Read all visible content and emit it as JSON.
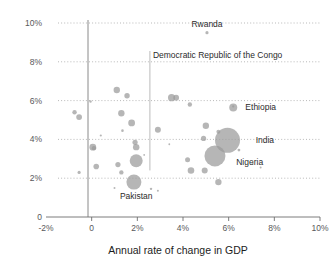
{
  "chart_data": {
    "type": "scatter",
    "title": "",
    "xlabel": "Annual rate of change in GDP",
    "ylabel": "",
    "xlim": [
      -2,
      10
    ],
    "ylim": [
      0,
      10
    ],
    "x_ticks": [
      "-2%",
      "0",
      "2%",
      "4%",
      "6%",
      "8%",
      "10%"
    ],
    "x_tick_values": [
      -2,
      0,
      2,
      4,
      6,
      8,
      10
    ],
    "y_ticks": [
      "0",
      "2%",
      "4%",
      "6%",
      "8%",
      "10%"
    ],
    "y_tick_values": [
      0,
      2,
      4,
      6,
      8,
      10
    ],
    "grid": "horizontal-dotted",
    "legend": "none",
    "bubble_color": "#9a9a9a",
    "note": "Bubble area encodes population size; x = annual rate of change in GDP, y = annual rate of change (percent)",
    "annotations": [
      {
        "label": "Rwanda",
        "x": 5.05,
        "y": 9.95,
        "anchor": "middle",
        "leader": "none"
      },
      {
        "label": "Democratic Republic of the Congo",
        "x": 2.55,
        "y": 8.35,
        "anchor": "start",
        "leader": "vertical"
      },
      {
        "label": "Ethiopia",
        "x": 6.6,
        "y": 5.65,
        "anchor": "start",
        "leader": "none"
      },
      {
        "label": "India",
        "x": 7.05,
        "y": 3.95,
        "anchor": "start",
        "leader": "none"
      },
      {
        "label": "Nigeria",
        "x": 6.2,
        "y": 2.85,
        "anchor": "start",
        "leader": "none"
      },
      {
        "label": "Pakistan",
        "x": 1.95,
        "y": 1.1,
        "anchor": "middle",
        "leader": "none"
      }
    ],
    "points": [
      {
        "x": 5.05,
        "y": 9.5,
        "r": 1.6
      },
      {
        "x": 1.1,
        "y": 6.55,
        "r": 3.2
      },
      {
        "x": 1.55,
        "y": 6.25,
        "r": 2.7
      },
      {
        "x": 3.5,
        "y": 6.15,
        "r": 3.6
      },
      {
        "x": 3.7,
        "y": 6.15,
        "r": 2.9
      },
      {
        "x": -0.05,
        "y": 5.95,
        "r": 1.2
      },
      {
        "x": 4.3,
        "y": 5.8,
        "r": 2.2
      },
      {
        "x": 6.2,
        "y": 5.65,
        "r": 4.0
      },
      {
        "x": -0.75,
        "y": 5.4,
        "r": 2.2
      },
      {
        "x": -0.55,
        "y": 5.15,
        "r": 2.9
      },
      {
        "x": 1.3,
        "y": 5.35,
        "r": 3.2
      },
      {
        "x": 1.75,
        "y": 4.85,
        "r": 3.4
      },
      {
        "x": 2.9,
        "y": 4.5,
        "r": 3.0
      },
      {
        "x": 1.35,
        "y": 4.45,
        "r": 1.3
      },
      {
        "x": 5.0,
        "y": 4.7,
        "r": 3.2
      },
      {
        "x": 5.55,
        "y": 4.4,
        "r": 2.0
      },
      {
        "x": 0.4,
        "y": 4.2,
        "r": 1.1
      },
      {
        "x": 5.95,
        "y": 3.95,
        "r": 12.5
      },
      {
        "x": 4.9,
        "y": 4.05,
        "r": 2.6
      },
      {
        "x": 1.9,
        "y": 3.85,
        "r": 2.6
      },
      {
        "x": 1.95,
        "y": 3.6,
        "r": 3.2
      },
      {
        "x": 0.05,
        "y": 3.6,
        "r": 3.4
      },
      {
        "x": 0.1,
        "y": 3.55,
        "r": 2.2
      },
      {
        "x": 5.4,
        "y": 3.15,
        "r": 10.5
      },
      {
        "x": 6.45,
        "y": 3.45,
        "r": 1.4
      },
      {
        "x": 4.2,
        "y": 2.95,
        "r": 2.5
      },
      {
        "x": 1.95,
        "y": 2.9,
        "r": 6.5
      },
      {
        "x": 1.15,
        "y": 2.7,
        "r": 2.6
      },
      {
        "x": 0.2,
        "y": 2.6,
        "r": 2.8
      },
      {
        "x": 7.05,
        "y": 2.75,
        "r": 1.1
      },
      {
        "x": 4.35,
        "y": 2.4,
        "r": 3.3
      },
      {
        "x": 4.95,
        "y": 2.4,
        "r": 3.0
      },
      {
        "x": 1.3,
        "y": 2.3,
        "r": 2.2
      },
      {
        "x": -0.55,
        "y": 2.3,
        "r": 1.6
      },
      {
        "x": 1.85,
        "y": 1.8,
        "r": 7.5
      },
      {
        "x": 5.55,
        "y": 1.8,
        "r": 3.2
      },
      {
        "x": 7.4,
        "y": 2.55,
        "r": 1.0
      },
      {
        "x": 2.6,
        "y": 1.45,
        "r": 1.2
      },
      {
        "x": 2.9,
        "y": 1.35,
        "r": 1.0
      },
      {
        "x": 1.0,
        "y": 1.5,
        "r": 1.0
      },
      {
        "x": 2.3,
        "y": 3.2,
        "r": 0.9
      },
      {
        "x": 3.4,
        "y": 3.75,
        "r": 0.9
      },
      {
        "x": 6.2,
        "y": 5.7,
        "r": 1.1
      }
    ]
  }
}
